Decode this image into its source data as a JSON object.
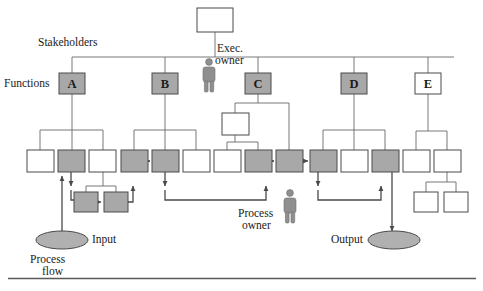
{
  "diagram": {
    "colors": {
      "shaded_fill": "#a8a8a8",
      "plain_fill": "#ffffff",
      "stroke": "#4a4a4a",
      "flow_stroke": "#5a5a5a",
      "text": "#1a1a1a",
      "person_fill": "#8f8f8f",
      "ellipse_fill": "#b0b0b0",
      "rule": "#5a5a5a"
    },
    "labels": {
      "stakeholders": "Stakeholders",
      "functions": "Functions",
      "exec_owner_line1": "Exec.",
      "exec_owner_line2": "owner",
      "process_owner_line1": "Process",
      "process_owner_line2": "owner",
      "input": "Input",
      "output": "Output",
      "process_flow_line1": "Process",
      "process_flow_line2": "flow"
    },
    "function_boxes": [
      {
        "label": "A",
        "shaded": true,
        "x": 59,
        "y": 73,
        "w": 26,
        "h": 21
      },
      {
        "label": "B",
        "shaded": true,
        "x": 152,
        "y": 73,
        "w": 26,
        "h": 21
      },
      {
        "label": "C",
        "shaded": true,
        "x": 245,
        "y": 73,
        "w": 26,
        "h": 21
      },
      {
        "label": "D",
        "shaded": true,
        "x": 341,
        "y": 73,
        "w": 26,
        "h": 21
      },
      {
        "label": "E",
        "shaded": false,
        "x": 415,
        "y": 73,
        "w": 26,
        "h": 21
      }
    ],
    "top_box": {
      "label": "",
      "shaded": false,
      "x": 197,
      "y": 8,
      "w": 36,
      "h": 24
    },
    "middle_row_boxes": [
      {
        "id": "a-left",
        "shaded": false,
        "x": 27,
        "y": 150,
        "w": 27,
        "h": 22
      },
      {
        "id": "a-center",
        "shaded": true,
        "x": 58,
        "y": 150,
        "w": 27,
        "h": 22
      },
      {
        "id": "a-right",
        "shaded": false,
        "x": 89,
        "y": 150,
        "w": 27,
        "h": 22
      },
      {
        "id": "b-left",
        "shaded": true,
        "x": 121,
        "y": 150,
        "w": 27,
        "h": 22
      },
      {
        "id": "b-center",
        "shaded": true,
        "x": 152,
        "y": 150,
        "w": 27,
        "h": 22
      },
      {
        "id": "b-right",
        "shaded": false,
        "x": 183,
        "y": 150,
        "w": 27,
        "h": 22
      },
      {
        "id": "c-left",
        "shaded": false,
        "x": 214,
        "y": 150,
        "w": 27,
        "h": 22
      },
      {
        "id": "c-mid",
        "shaded": true,
        "x": 245,
        "y": 150,
        "w": 27,
        "h": 22
      },
      {
        "id": "c-right",
        "shaded": true,
        "x": 276,
        "y": 150,
        "w": 27,
        "h": 22
      },
      {
        "id": "d-left",
        "shaded": true,
        "x": 310,
        "y": 150,
        "w": 27,
        "h": 22
      },
      {
        "id": "d-center",
        "shaded": false,
        "x": 341,
        "y": 150,
        "w": 27,
        "h": 22
      },
      {
        "id": "d-right",
        "shaded": true,
        "x": 372,
        "y": 150,
        "w": 27,
        "h": 22
      },
      {
        "id": "e-left",
        "shaded": false,
        "x": 403,
        "y": 150,
        "w": 27,
        "h": 22
      },
      {
        "id": "e-right",
        "shaded": false,
        "x": 434,
        "y": 150,
        "w": 27,
        "h": 22
      }
    ],
    "lower_boxes": [
      {
        "id": "a-low-left",
        "shaded": true,
        "x": 74,
        "y": 192,
        "w": 24,
        "h": 20
      },
      {
        "id": "a-low-right",
        "shaded": true,
        "x": 104,
        "y": 192,
        "w": 24,
        "h": 20
      },
      {
        "id": "c-sub",
        "shaded": false,
        "x": 222,
        "y": 113,
        "w": 27,
        "h": 22
      },
      {
        "id": "e-sub-left",
        "shaded": false,
        "x": 414,
        "y": 192,
        "w": 24,
        "h": 20
      },
      {
        "id": "e-sub-right",
        "shaded": false,
        "x": 444,
        "y": 192,
        "w": 24,
        "h": 20
      }
    ],
    "ellipses": [
      {
        "id": "input-ellipse",
        "cx": 62,
        "cy": 240,
        "rx": 26,
        "ry": 9
      },
      {
        "id": "output-ellipse",
        "cx": 394,
        "cy": 240,
        "rx": 26,
        "ry": 9
      }
    ],
    "people": [
      {
        "id": "exec-owner-figure",
        "x": 203,
        "y": 58
      },
      {
        "id": "process-owner-figure",
        "x": 284,
        "y": 189
      }
    ]
  }
}
